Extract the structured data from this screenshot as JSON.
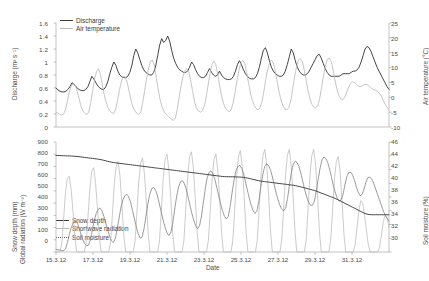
{
  "figure": {
    "width": 427,
    "height": 281,
    "background": "#ffffff",
    "colors": {
      "discharge": "#3b3b3b",
      "air_temperature": "#b9b9b9",
      "snow_depth": "#3b3b3b",
      "shortwave_radiation": "#c2c2c2",
      "soil_moisture": "#7d7d7d",
      "axis": "#9a9a9a",
      "text": "#4a4a4a"
    }
  },
  "xaxis": {
    "label": "Date",
    "ticks": [
      "15.3.12",
      "17.3.12",
      "19.3.12",
      "21.3.12",
      "23.3.12",
      "25.3.12",
      "27.3.12",
      "29.3.12",
      "31.3.12"
    ],
    "range_days": [
      0,
      18
    ]
  },
  "top_panel": {
    "left_axis": {
      "title": "Discharge (m³ s⁻¹)",
      "ticks": [
        "0",
        "0.2",
        "0.4",
        "0.6",
        "0.8",
        "1",
        "1.2",
        "1.4",
        "1.6"
      ],
      "min": 0,
      "max": 1.6
    },
    "right_axis": {
      "title": "Air temperature (°C)",
      "ticks": [
        "-10",
        "-5",
        "0",
        "5",
        "10",
        "15",
        "20",
        "25"
      ],
      "min": -10,
      "max": 25
    },
    "legend": [
      {
        "label": "Discharge",
        "style": "solid-dark",
        "name": "legend-discharge"
      },
      {
        "label": "Air temperature",
        "style": "solid-light",
        "name": "legend-air-temperature"
      }
    ]
  },
  "bottom_panel": {
    "left_axis": {
      "title": "Snow depth (mm)\nGlobal radiation (W m⁻²)",
      "title_line1": "Snow depth (mm)",
      "title_line2": "Global radiation (W m⁻²)",
      "ticks": [
        "0",
        "100",
        "200",
        "300",
        "400",
        "500",
        "600",
        "700",
        "800",
        "900"
      ],
      "min": 0,
      "max": 900
    },
    "right_axis": {
      "title": "Soil moisture (%)",
      "ticks": [
        "30",
        "32",
        "34",
        "36",
        "38",
        "40",
        "42",
        "44",
        "46"
      ],
      "min": 30,
      "max": 46
    },
    "legend": [
      {
        "label": "Snow depth",
        "style": "solid-dark",
        "name": "legend-snow-depth"
      },
      {
        "label": "Shortwave radiation",
        "style": "solid-light",
        "name": "legend-shortwave-radiation"
      },
      {
        "label": "Soil moisture",
        "style": "dotted",
        "name": "legend-soil-moisture"
      }
    ]
  },
  "chart_data": [
    {
      "type": "line",
      "title": "",
      "panel": "top",
      "xlabel": "",
      "ylabel": "Discharge (m³ s⁻¹)",
      "y2label": "Air temperature (°C)",
      "ylim": [
        0,
        1.6
      ],
      "y2lim": [
        -10,
        25
      ],
      "xlim": [
        "15.3.12",
        "1.4.12"
      ],
      "xtick_labels": [
        "15.3.12",
        "17.3.12",
        "19.3.12",
        "21.3.12",
        "23.3.12",
        "25.3.12",
        "27.3.12",
        "29.3.12",
        "31.3.12"
      ],
      "grid": false,
      "legend_position": "top-left",
      "series": [
        {
          "name": "Discharge",
          "axis": "left",
          "unit": "m3 s-1",
          "values": [
            0.6,
            0.57,
            0.55,
            0.54,
            0.54,
            0.55,
            0.58,
            0.62,
            0.68,
            0.66,
            0.62,
            0.59,
            0.57,
            0.56,
            0.56,
            0.58,
            0.62,
            0.7,
            0.78,
            0.74,
            0.68,
            0.63,
            0.6,
            0.58,
            0.58,
            0.62,
            0.7,
            0.82,
            0.92,
            1.0,
            0.95,
            0.86,
            0.8,
            0.77,
            0.76,
            0.76,
            0.78,
            0.84,
            0.94,
            1.1,
            1.2,
            1.14,
            1.04,
            0.95,
            0.88,
            0.84,
            0.82,
            0.8,
            0.8,
            0.84,
            0.94,
            1.1,
            1.26,
            1.36,
            1.3,
            1.33,
            1.4,
            1.32,
            1.18,
            1.06,
            0.98,
            0.92,
            0.88,
            0.86,
            0.84,
            0.84,
            0.86,
            0.92,
            1.0,
            0.96,
            0.88,
            0.82,
            0.78,
            0.76,
            0.76,
            0.78,
            0.84,
            0.9,
            0.84,
            0.8,
            0.78,
            0.8,
            0.86,
            0.8,
            0.76,
            0.74,
            0.73,
            0.73,
            0.74,
            0.78,
            0.86,
            0.96,
            1.02,
            0.96,
            0.88,
            0.82,
            0.78,
            0.75,
            0.74,
            0.74,
            0.76,
            0.82,
            0.92,
            1.06,
            1.18,
            1.22,
            1.14,
            1.02,
            0.92,
            0.86,
            0.82,
            0.8,
            0.78,
            0.78,
            0.8,
            0.86,
            0.96,
            1.08,
            1.2,
            1.14,
            1.02,
            0.92,
            0.86,
            0.82,
            0.8,
            0.8,
            0.82,
            0.86,
            0.92,
            0.98,
            1.04,
            1.1,
            1.12,
            1.06,
            0.98,
            0.9,
            0.84,
            0.8,
            0.78,
            0.78,
            0.78,
            0.78,
            0.78,
            0.8,
            0.82,
            0.82,
            0.82,
            0.82,
            0.84,
            0.86,
            0.86,
            0.88,
            0.92,
            1.0,
            1.1,
            1.2,
            1.24,
            1.22,
            1.16,
            1.08,
            1.0,
            0.92,
            0.86,
            0.8,
            0.74,
            0.68,
            0.62,
            0.58
          ]
        },
        {
          "name": "Air temperature",
          "axis": "right",
          "unit": "degC",
          "values": [
            -5.0,
            -5.4,
            -5.8,
            -6.0,
            -5.6,
            -4.0,
            -1.0,
            2.0,
            4.0,
            4.6,
            4.0,
            2.0,
            -0.5,
            -3.0,
            -4.6,
            -5.4,
            -5.8,
            -5.0,
            -2.0,
            2.0,
            6.0,
            8.5,
            9.6,
            8.0,
            4.5,
            1.0,
            -1.5,
            -3.5,
            -4.6,
            -5.2,
            -5.4,
            -4.0,
            -1.0,
            2.5,
            5.5,
            7.0,
            6.8,
            5.0,
            2.0,
            -1.0,
            -3.4,
            -4.6,
            -5.4,
            -5.8,
            -5.0,
            -2.0,
            2.0,
            6.0,
            9.5,
            12.0,
            12.5,
            11.0,
            7.0,
            3.0,
            -0.5,
            -3.0,
            -4.6,
            -5.6,
            -6.2,
            -6.8,
            -7.4,
            -7.8,
            -7.0,
            -4.0,
            0.0,
            4.0,
            7.0,
            9.0,
            9.6,
            8.5,
            5.5,
            2.0,
            -1.5,
            -3.6,
            -4.6,
            -5.0,
            -4.6,
            -3.0,
            0.0,
            4.0,
            8.0,
            11.0,
            12.2,
            11.0,
            8.0,
            4.0,
            0.5,
            -2.0,
            -3.6,
            -4.4,
            -4.8,
            -4.2,
            -2.0,
            1.5,
            5.5,
            9.0,
            11.5,
            12.4,
            11.5,
            8.5,
            5.0,
            1.5,
            -1.0,
            -2.8,
            -3.8,
            -4.2,
            -3.6,
            -1.5,
            2.0,
            6.0,
            9.5,
            11.8,
            12.5,
            11.5,
            8.5,
            5.0,
            1.5,
            -1.2,
            -3.0,
            -4.0,
            -4.2,
            -3.4,
            -1.0,
            3.0,
            7.0,
            10.5,
            12.6,
            13.0,
            12.0,
            9.0,
            5.5,
            2.0,
            -0.6,
            -2.4,
            -3.4,
            -3.6,
            -2.8,
            -0.4,
            3.4,
            7.4,
            10.8,
            12.8,
            13.2,
            12.0,
            9.0,
            5.5,
            2.5,
            0.5,
            -0.6,
            -0.8,
            0.0,
            1.6,
            3.4,
            4.6,
            5.2,
            5.0,
            4.4,
            3.8,
            3.6,
            3.8,
            4.2,
            4.4,
            4.2,
            3.6,
            3.0,
            2.6,
            2.4,
            2.0,
            1.4,
            0.4,
            -1.0,
            -2.4,
            -3.4,
            -4.0
          ]
        }
      ]
    },
    {
      "type": "line",
      "title": "",
      "panel": "bottom",
      "xlabel": "Date",
      "ylabel": "Snow depth (mm) / Global radiation (W m-2)",
      "y2label": "Soil moisture (%)",
      "ylim": [
        0,
        900
      ],
      "y2lim": [
        30,
        46
      ],
      "xlim": [
        "15.3.12",
        "1.4.12"
      ],
      "xtick_labels": [
        "15.3.12",
        "17.3.12",
        "19.3.12",
        "21.3.12",
        "23.3.12",
        "25.3.12",
        "27.3.12",
        "29.3.12",
        "31.3.12"
      ],
      "grid": false,
      "legend_position": "left-lower",
      "series": [
        {
          "name": "Snow depth",
          "axis": "left",
          "unit": "mm",
          "values": [
            790,
            790,
            789,
            788,
            788,
            787,
            786,
            786,
            785,
            784,
            783,
            782,
            780,
            778,
            776,
            774,
            772,
            770,
            768,
            766,
            764,
            762,
            760,
            757,
            754,
            750,
            746,
            742,
            738,
            735,
            732,
            730,
            728,
            726,
            724,
            722,
            720,
            718,
            716,
            714,
            712,
            710,
            708,
            706,
            704,
            702,
            700,
            698,
            696,
            694,
            692,
            690,
            688,
            686,
            684,
            682,
            680,
            678,
            676,
            674,
            672,
            670,
            668,
            666,
            664,
            662,
            660,
            658,
            656,
            654,
            652,
            650,
            648,
            646,
            644,
            642,
            640,
            638,
            636,
            634,
            632,
            630,
            628,
            626,
            624,
            622,
            620,
            618,
            617,
            616,
            616,
            616,
            615,
            615,
            614,
            614,
            613,
            612,
            610,
            608,
            605,
            602,
            598,
            594,
            590,
            586,
            583,
            580,
            578,
            576,
            574,
            572,
            570,
            568,
            566,
            564,
            562,
            560,
            558,
            556,
            554,
            552,
            550,
            548,
            546,
            543,
            540,
            536,
            532,
            528,
            524,
            520,
            516,
            512,
            508,
            503,
            498,
            492,
            486,
            480,
            474,
            468,
            462,
            456,
            450,
            444,
            437,
            430,
            422,
            414,
            406,
            398,
            390,
            382,
            374,
            366,
            358,
            350,
            342,
            334,
            326,
            318,
            312,
            308,
            306,
            305,
            305,
            305,
            305,
            305,
            305,
            305,
            305,
            305,
            305
          ]
        },
        {
          "name": "Shortwave radiation",
          "axis": "left",
          "unit": "W m-2",
          "values": [
            0,
            0,
            0,
            60,
            260,
            480,
            600,
            620,
            520,
            340,
            120,
            0,
            0,
            0,
            0,
            0,
            70,
            290,
            520,
            660,
            690,
            570,
            370,
            130,
            0,
            0,
            0,
            0,
            0,
            80,
            310,
            560,
            700,
            740,
            620,
            400,
            140,
            0,
            0,
            0,
            0,
            0,
            85,
            320,
            580,
            730,
            770,
            640,
            420,
            150,
            0,
            0,
            0,
            0,
            0,
            90,
            340,
            600,
            760,
            800,
            670,
            440,
            160,
            0,
            0,
            0,
            0,
            0,
            95,
            350,
            620,
            780,
            820,
            690,
            450,
            165,
            0,
            0,
            0,
            0,
            0,
            95,
            340,
            600,
            760,
            800,
            670,
            440,
            160,
            0,
            0,
            0,
            0,
            0,
            95,
            350,
            620,
            780,
            830,
            700,
            460,
            170,
            0,
            0,
            0,
            0,
            0,
            98,
            360,
            630,
            790,
            840,
            710,
            470,
            175,
            0,
            0,
            0,
            0,
            0,
            98,
            360,
            630,
            790,
            840,
            710,
            470,
            175,
            0,
            0,
            0,
            0,
            0,
            98,
            360,
            630,
            790,
            840,
            710,
            470,
            175,
            0,
            0,
            0,
            0,
            0,
            95,
            340,
            590,
            740,
            780,
            660,
            430,
            155,
            0,
            0,
            0,
            0,
            0,
            60,
            200,
            340,
            420,
            400,
            300,
            180,
            60,
            0,
            0,
            0,
            0,
            0,
            40,
            140,
            250,
            300,
            280,
            200
          ]
        },
        {
          "name": "Soil moisture",
          "axis": "right",
          "unit": "%",
          "values": [
            30.4,
            30.3,
            30.3,
            30.2,
            30.2,
            30.5,
            31.4,
            32.6,
            33.6,
            34.2,
            34.5,
            34.3,
            33.6,
            32.6,
            31.8,
            31.2,
            30.9,
            31.0,
            31.8,
            33.2,
            34.6,
            35.6,
            36.2,
            36.4,
            36.0,
            35.2,
            34.2,
            33.2,
            32.3,
            31.6,
            31.4,
            32.0,
            33.4,
            35.0,
            36.6,
            37.6,
            38.2,
            38.4,
            38.0,
            37.2,
            36.0,
            34.8,
            33.6,
            32.6,
            32.0,
            32.2,
            33.4,
            35.2,
            37.0,
            38.4,
            39.2,
            39.4,
            39.0,
            38.2,
            37.0,
            35.8,
            34.6,
            33.6,
            32.8,
            32.4,
            32.8,
            34.2,
            36.2,
            38.0,
            39.4,
            40.2,
            40.4,
            40.0,
            39.2,
            38.0,
            36.8,
            35.6,
            34.6,
            33.8,
            33.4,
            33.8,
            35.2,
            37.2,
            39.2,
            40.8,
            41.6,
            41.8,
            41.4,
            40.6,
            39.4,
            38.2,
            37.0,
            36.0,
            35.2,
            34.8,
            35.2,
            36.6,
            38.6,
            40.4,
            41.8,
            42.4,
            42.6,
            42.2,
            41.4,
            40.2,
            39.0,
            37.8,
            36.8,
            36.0,
            35.6,
            36.0,
            37.4,
            39.4,
            41.2,
            42.4,
            42.8,
            42.6,
            42.0,
            41.0,
            39.8,
            38.6,
            37.6,
            36.8,
            36.2,
            36.0,
            36.4,
            37.8,
            39.8,
            41.6,
            42.8,
            43.2,
            43.0,
            42.4,
            41.4,
            40.2,
            39.0,
            38.0,
            37.2,
            36.8,
            36.8,
            37.4,
            38.8,
            40.6,
            42.2,
            43.4,
            43.8,
            43.6,
            43.0,
            42.0,
            40.8,
            39.6,
            38.6,
            37.8,
            37.4,
            37.6,
            38.4,
            39.8,
            41.0,
            41.6,
            41.6,
            41.2,
            40.4,
            39.4,
            38.6,
            38.2,
            38.4,
            39.2,
            40.2,
            40.8,
            40.9,
            40.6,
            40.0,
            39.2,
            38.4,
            37.6,
            36.8,
            36.0,
            35.4,
            34.9,
            34.5
          ]
        }
      ]
    }
  ]
}
